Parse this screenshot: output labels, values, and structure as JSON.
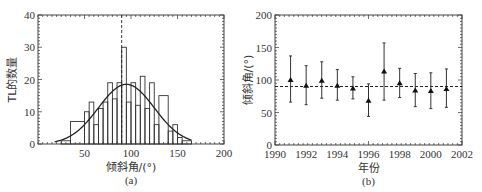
{
  "chart_data": [
    {
      "id": "a",
      "type": "bar",
      "subtype": "histogram-with-fit",
      "caption": "(a)",
      "title": "",
      "xlabel": "倾斜角/(°)",
      "ylabel": "TL的数量",
      "xlim": [
        0,
        200
      ],
      "ylim": [
        0,
        40
      ],
      "xticks": [
        50,
        100,
        150,
        200
      ],
      "yticks": [
        0,
        10,
        20,
        30,
        40
      ],
      "grid": false,
      "bin_width": 5,
      "bins": [
        {
          "x0": 25,
          "x1": 35,
          "count": 1
        },
        {
          "x0": 35,
          "x1": 50,
          "count": 7
        },
        {
          "x0": 50,
          "x1": 55,
          "count": 10
        },
        {
          "x0": 55,
          "x1": 60,
          "count": 13
        },
        {
          "x0": 60,
          "x1": 65,
          "count": 6
        },
        {
          "x0": 65,
          "x1": 70,
          "count": 11
        },
        {
          "x0": 70,
          "x1": 75,
          "count": 13
        },
        {
          "x0": 75,
          "x1": 80,
          "count": 19
        },
        {
          "x0": 80,
          "x1": 85,
          "count": 14
        },
        {
          "x0": 85,
          "x1": 90,
          "count": 19
        },
        {
          "x0": 90,
          "x1": 95,
          "count": 30
        },
        {
          "x0": 95,
          "x1": 100,
          "count": 13
        },
        {
          "x0": 100,
          "x1": 105,
          "count": 19
        },
        {
          "x0": 105,
          "x1": 110,
          "count": 12
        },
        {
          "x0": 110,
          "x1": 115,
          "count": 21
        },
        {
          "x0": 115,
          "x1": 120,
          "count": 11
        },
        {
          "x0": 120,
          "x1": 125,
          "count": 19
        },
        {
          "x0": 125,
          "x1": 130,
          "count": 6
        },
        {
          "x0": 130,
          "x1": 140,
          "count": 15
        },
        {
          "x0": 140,
          "x1": 145,
          "count": 4
        },
        {
          "x0": 145,
          "x1": 150,
          "count": 6
        },
        {
          "x0": 150,
          "x1": 155,
          "count": 2
        },
        {
          "x0": 155,
          "x1": 165,
          "count": 1
        }
      ],
      "fit_curve": {
        "type": "gaussian",
        "peak": 18.5,
        "mean": 95,
        "sigma": 30,
        "x_range": [
          18,
          165
        ]
      },
      "reference_line": {
        "x": 90,
        "style": "dashed"
      }
    },
    {
      "id": "b",
      "type": "scatter",
      "subtype": "errorbar",
      "caption": "(b)",
      "title": "",
      "xlabel": "年份",
      "ylabel": "倾斜角/(°)",
      "xlim": [
        1990,
        2002
      ],
      "ylim": [
        0,
        200
      ],
      "xticks": [
        1990,
        1992,
        1994,
        1996,
        1998,
        2000,
        2002
      ],
      "yticks": [
        0,
        50,
        100,
        150,
        200
      ],
      "grid": false,
      "marker": "triangle",
      "points": [
        {
          "x": 1991,
          "y": 100,
          "low": 66,
          "high": 137
        },
        {
          "x": 1992,
          "y": 91,
          "low": 62,
          "high": 122
        },
        {
          "x": 1993,
          "y": 99,
          "low": 72,
          "high": 128
        },
        {
          "x": 1994,
          "y": 91,
          "low": 69,
          "high": 116
        },
        {
          "x": 1995,
          "y": 87,
          "low": 71,
          "high": 105
        },
        {
          "x": 1996,
          "y": 68,
          "low": 44,
          "high": 94
        },
        {
          "x": 1997,
          "y": 113,
          "low": 69,
          "high": 157
        },
        {
          "x": 1998,
          "y": 95,
          "low": 73,
          "high": 118
        },
        {
          "x": 1999,
          "y": 84,
          "low": 59,
          "high": 110
        },
        {
          "x": 2000,
          "y": 83,
          "low": 56,
          "high": 111
        },
        {
          "x": 2001,
          "y": 86,
          "low": 58,
          "high": 117
        }
      ],
      "reference_line": {
        "y": 90,
        "style": "dashed"
      }
    }
  ],
  "colors": {
    "line": "#333333",
    "frame": "#444444",
    "background": "#ffffff"
  }
}
